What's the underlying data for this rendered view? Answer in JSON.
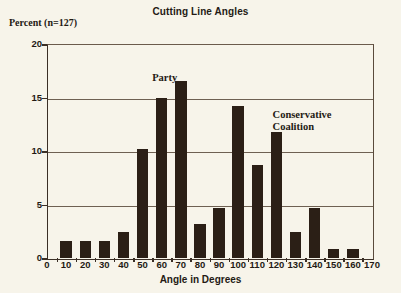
{
  "chart_data": {
    "type": "bar",
    "title": "Cutting Line Angles",
    "xlabel": "Angle in Degrees",
    "ylabel": "Percent (n=127)",
    "categories": [
      "10",
      "20",
      "30",
      "40",
      "50",
      "60",
      "70",
      "80",
      "90",
      "100",
      "110",
      "120",
      "130",
      "140",
      "150",
      "160"
    ],
    "values": [
      1.6,
      1.6,
      1.6,
      2.4,
      10.2,
      15.0,
      16.5,
      3.2,
      4.7,
      14.2,
      8.7,
      11.8,
      2.4,
      4.7,
      0.8,
      0.8
    ],
    "x_tick_labels": [
      "0",
      "10",
      "20",
      "30",
      "40",
      "50",
      "60",
      "70",
      "80",
      "90",
      "100",
      "110",
      "120",
      "130",
      "140",
      "150",
      "160",
      "170"
    ],
    "y_tick_labels": [
      "0",
      "5",
      "10",
      "15",
      "20"
    ],
    "ylim": [
      0,
      20
    ],
    "xlim": [
      0,
      170
    ],
    "grid": "horizontal",
    "legend": "none",
    "annotations": [
      {
        "text": "Party",
        "x": 55,
        "y": 17.4
      },
      {
        "text": "Conservative\nCoalition",
        "x": 118,
        "y": 13.9
      }
    ]
  },
  "colors": {
    "bar": "#2b1f16",
    "background": "#f7f4ea",
    "axis": "#3b2f26",
    "gridline": "#6e6052",
    "text": "#241a14"
  }
}
